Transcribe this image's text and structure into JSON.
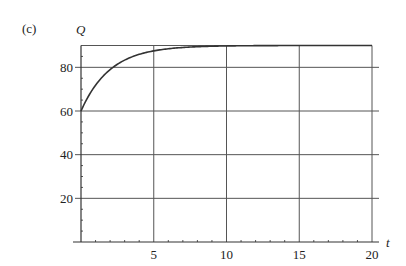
{
  "panel_label": "(c)",
  "chart_data": {
    "type": "line",
    "title": "",
    "xlabel": "t",
    "ylabel": "Q",
    "xlim": [
      0,
      20
    ],
    "ylim": [
      0,
      90
    ],
    "grid": true,
    "x_ticks": [
      5,
      10,
      15,
      20
    ],
    "y_ticks": [
      20,
      40,
      60,
      80
    ],
    "x_tick_labels": [
      "5",
      "10",
      "15",
      "20"
    ],
    "y_tick_labels": [
      "20",
      "40",
      "60",
      "80"
    ],
    "series": [
      {
        "name": "Q(t)",
        "x": [
          0,
          0.5,
          1,
          1.5,
          2,
          3,
          4,
          5,
          6,
          8,
          10,
          15,
          20
        ],
        "values": [
          60,
          66.6,
          71.8,
          75.8,
          79.0,
          83.3,
          85.9,
          87.5,
          88.5,
          89.5,
          89.8,
          90.0,
          90.0
        ]
      }
    ],
    "annotations": [
      "(c)"
    ]
  }
}
